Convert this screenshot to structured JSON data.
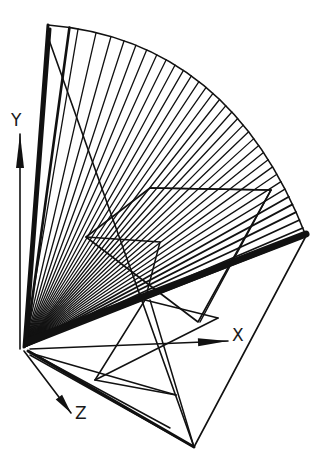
{
  "figure": {
    "background": "#ffffff",
    "ink": "#111111"
  },
  "axes": {
    "origin": [
      22,
      349
    ],
    "x": {
      "label": "X",
      "end": [
        228,
        341
      ],
      "label_pos": [
        232,
        341
      ]
    },
    "y": {
      "label": "Y",
      "end": [
        20,
        134
      ],
      "label_pos": [
        11,
        126
      ]
    },
    "z": {
      "label": "Z",
      "end": [
        71,
        413
      ],
      "label_pos": [
        75,
        419
      ]
    }
  },
  "geometry": {
    "apex_top_left": [
      48,
      25
    ],
    "arc_right_end": [
      306,
      236
    ],
    "bottom_apex": [
      194,
      447
    ],
    "arc_control": [
      230,
      40
    ],
    "fan_ray_count": 34,
    "inner_quad": [
      [
        86,
        237
      ],
      [
        150,
        188
      ],
      [
        271,
        190
      ],
      [
        198,
        322
      ]
    ],
    "diagonal": [
      [
        48,
        37
      ],
      [
        194,
        447
      ]
    ],
    "inner_lines": [
      [
        [
          86,
          237
        ],
        [
          160,
          242
        ]
      ],
      [
        [
          150,
          188
        ],
        [
          271,
          190
        ]
      ],
      [
        [
          271,
          190
        ],
        [
          200,
          322
        ]
      ],
      [
        [
          160,
          242
        ],
        [
          145,
          300
        ]
      ],
      [
        [
          145,
          300
        ],
        [
          218,
          318
        ]
      ],
      [
        [
          218,
          318
        ],
        [
          95,
          380
        ]
      ],
      [
        [
          145,
          300
        ],
        [
          95,
          380
        ]
      ],
      [
        [
          95,
          380
        ],
        [
          176,
          395
        ]
      ],
      [
        [
          150,
          300
        ],
        [
          194,
          447
        ]
      ],
      [
        [
          30,
          353
        ],
        [
          176,
          395
        ]
      ],
      [
        [
          30,
          355
        ],
        [
          194,
          447
        ]
      ],
      [
        [
          30,
          352
        ],
        [
          170,
          428
        ]
      ]
    ]
  }
}
